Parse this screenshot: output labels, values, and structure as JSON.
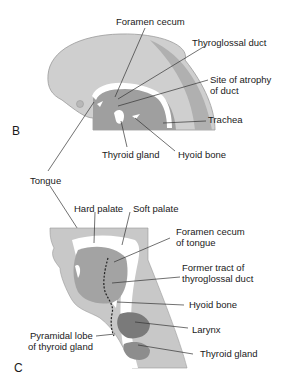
{
  "panels": {
    "B": {
      "letter": "B",
      "labels": {
        "foramen_cecum": "Foramen cecum",
        "thyroglossal_duct": "Thyroglossal duct",
        "site_atrophy_1": "Site of atrophy",
        "site_atrophy_2": "of duct",
        "trachea": "Trachea",
        "thyroid_gland": "Thyroid gland",
        "hyoid_bone": "Hyoid bone",
        "tongue": "Tongue"
      }
    },
    "C": {
      "letter": "C",
      "labels": {
        "hard_palate": "Hard palate",
        "soft_palate": "Soft palate",
        "foramen_cecum_1": "Foramen cecum",
        "foramen_cecum_2": "of tongue",
        "former_tract_1": "Former tract of",
        "former_tract_2": "thyroglossal duct",
        "hyoid_bone": "Hyoid bone",
        "larynx": "Larynx",
        "pyramidal_1": "Pyramidal lobe",
        "pyramidal_2": "of thyroid gland",
        "thyroid_gland": "Thyroid gland"
      }
    }
  },
  "colors": {
    "light_gray": "#c4c4c4",
    "mid_gray": "#a6a6a6",
    "dark_gray": "#7e7e7e",
    "line": "#333333"
  }
}
